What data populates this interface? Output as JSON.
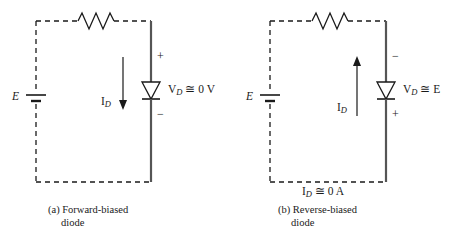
{
  "figure": {
    "type": "circuit-diagram",
    "panels": [
      {
        "id": "a",
        "caption_line1": "(a) Forward-biased",
        "caption_line2": "diode",
        "source_label": "E",
        "current_label": "I",
        "current_label_sub": "D",
        "current_direction": "down",
        "diode_voltage_label": "V",
        "diode_voltage_sub": "D",
        "diode_voltage_value": "≅ 0 V",
        "polarity_top": "+",
        "polarity_bottom": "−",
        "bottom_note": "",
        "components": [
          "resistor",
          "battery",
          "diode"
        ]
      },
      {
        "id": "b",
        "caption_line1": "(b) Reverse-biased",
        "caption_line2": "diode",
        "source_label": "E",
        "current_label": "I",
        "current_label_sub": "D",
        "current_direction": "up",
        "diode_voltage_label": "V",
        "diode_voltage_sub": "D",
        "diode_voltage_value": "≅ E",
        "polarity_top": "−",
        "polarity_bottom": "+",
        "bottom_note_label": "I",
        "bottom_note_sub": "D",
        "bottom_note_value": "≅ 0 A",
        "components": [
          "resistor",
          "battery",
          "diode"
        ]
      }
    ],
    "colors": {
      "line": "#1a1a1a",
      "solid_branch": "#4a4a4a",
      "background": "#ffffff",
      "text": "#1a1a1a"
    }
  }
}
